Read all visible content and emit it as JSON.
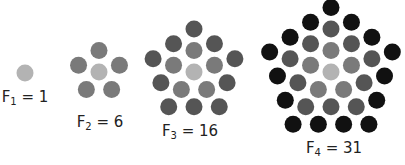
{
  "colors": {
    "ring0": "#b3b3b3",
    "ring1": "#7a7a7a",
    "ring2": "#555555",
    "ring3": "#111111",
    "background": "#ffffff"
  },
  "dot_radius": 8.5,
  "ring_spacing": 21.5,
  "figures": [
    {
      "id": "F1",
      "index": "1",
      "value": "1",
      "rings": 0,
      "cx": 25,
      "cy": 73,
      "label": {
        "letter": "F",
        "sub": "1",
        "eq": " = 1",
        "x": 25,
        "y": 88
      }
    },
    {
      "id": "F2",
      "index": "2",
      "value": "6",
      "rings": 1,
      "cx": 99,
      "cy": 72,
      "label": {
        "letter": "F",
        "sub": "2",
        "eq": " = 6",
        "x": 100,
        "y": 113
      }
    },
    {
      "id": "F3",
      "index": "3",
      "value": "16",
      "rings": 2,
      "cx": 194,
      "cy": 72,
      "label": {
        "letter": "F",
        "sub": "3",
        "eq": " = 16",
        "x": 190,
        "y": 122
      }
    },
    {
      "id": "F4",
      "index": "4",
      "value": "31",
      "rings": 3,
      "cx": 331,
      "cy": 72,
      "label": {
        "letter": "F",
        "sub": "4",
        "eq": " = 31",
        "x": 334,
        "y": 139
      }
    }
  ]
}
